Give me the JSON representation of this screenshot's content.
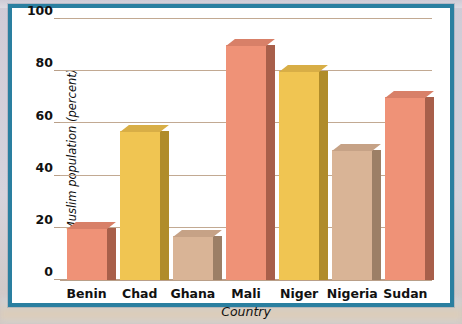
{
  "figure": {
    "frame_color": "#2a7fa0",
    "background_color": "#ffffff",
    "gridline_color": "#c2a992"
  },
  "chart_data": {
    "type": "bar",
    "title": "",
    "xlabel": "Country",
    "ylabel": "Muslim population (percent)",
    "categories": [
      "Benin",
      "Chad",
      "Ghana",
      "Mali",
      "Niger",
      "Nigeria",
      "Sudan"
    ],
    "values": [
      20,
      57,
      17,
      90,
      80,
      50,
      70
    ],
    "ylim": [
      0,
      100
    ],
    "yticks": [
      0,
      20,
      40,
      60,
      80,
      100
    ],
    "ytick_labels": [
      "0",
      "20",
      "40",
      "60",
      "80",
      "100"
    ],
    "grid": true,
    "legend": "none",
    "bar_colors": [
      "#ef9277",
      "#f0c552",
      "#d9b496",
      "#ef9277",
      "#f0c552",
      "#d9b496",
      "#ef9277"
    ],
    "bar_side_colors": [
      "#a85f4a",
      "#b08c2a",
      "#9c7f66",
      "#a85f4a",
      "#b08c2a",
      "#9c7f66",
      "#a85f4a"
    ],
    "bar_top_colors": [
      "#d88068",
      "#d8ae46",
      "#c6a286",
      "#d88068",
      "#d8ae46",
      "#c6a286",
      "#d88068"
    ],
    "style": "3d-bars"
  }
}
